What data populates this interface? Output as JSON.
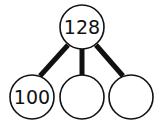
{
  "diagram": {
    "type": "number-bond",
    "whole": {
      "value": "128",
      "cx": 82,
      "cy": 27,
      "r": 22
    },
    "parts": [
      {
        "value": "100",
        "cx": 32,
        "cy": 97,
        "r": 22
      },
      {
        "value": "",
        "cx": 82,
        "cy": 97,
        "r": 22
      },
      {
        "value": "",
        "cx": 131,
        "cy": 97,
        "r": 22
      }
    ],
    "stroke_color": "#111111",
    "fill_color": "#ffffff"
  }
}
